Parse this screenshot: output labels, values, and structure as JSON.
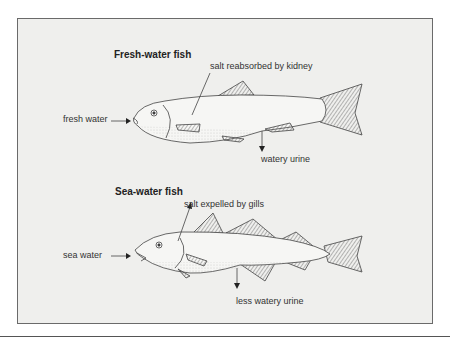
{
  "diagram": {
    "fresh": {
      "title": "Fresh-water fish",
      "labels": {
        "salt": "salt reabsorbed by kidney",
        "input": "fresh water",
        "output": "watery urine"
      }
    },
    "sea": {
      "title": "Sea-water fish",
      "labels": {
        "salt": "salt expelled by gills",
        "input": "sea water",
        "output": "less watery urine"
      }
    },
    "colors": {
      "background": "#efefed",
      "line": "#444444",
      "border": "#6a6a6a"
    }
  }
}
